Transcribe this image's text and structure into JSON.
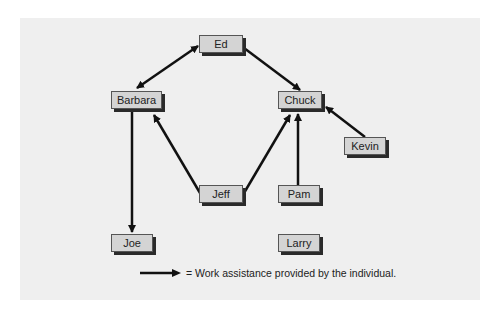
{
  "nodes": [
    {
      "id": "ed",
      "label": "Ed"
    },
    {
      "id": "barbara",
      "label": "Barbara"
    },
    {
      "id": "chuck",
      "label": "Chuck"
    },
    {
      "id": "kevin",
      "label": "Kevin"
    },
    {
      "id": "jeff",
      "label": "Jeff"
    },
    {
      "id": "pam",
      "label": "Pam"
    },
    {
      "id": "joe",
      "label": "Joe"
    },
    {
      "id": "larry",
      "label": "Larry"
    }
  ],
  "edges": [
    {
      "from": "ed",
      "to": "barbara",
      "bidirectional": true
    },
    {
      "from": "ed",
      "to": "chuck"
    },
    {
      "from": "barbara",
      "to": "joe"
    },
    {
      "from": "jeff",
      "to": "barbara"
    },
    {
      "from": "jeff",
      "to": "chuck"
    },
    {
      "from": "pam",
      "to": "chuck"
    },
    {
      "from": "kevin",
      "to": "chuck"
    }
  ],
  "legend": {
    "text": "= Work assistance provided by the individual."
  }
}
